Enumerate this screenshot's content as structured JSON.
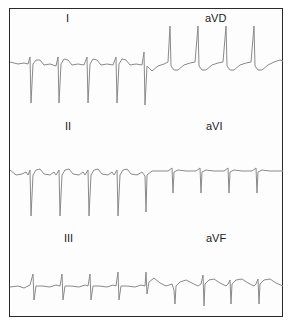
{
  "figure": {
    "type": "ECG limb leads strip",
    "leads": [
      {
        "name": "I",
        "row": 0,
        "side": "left",
        "qrs_polarity": "negative"
      },
      {
        "name": "aVD",
        "row": 0,
        "side": "right",
        "qrs_polarity": "positive"
      },
      {
        "name": "II",
        "row": 1,
        "side": "left",
        "qrs_polarity": "negative"
      },
      {
        "name": "aVI",
        "row": 1,
        "side": "right",
        "qrs_polarity": "negative-small"
      },
      {
        "name": "III",
        "row": 2,
        "side": "left",
        "qrs_polarity": "biphasic"
      },
      {
        "name": "aVF",
        "row": 2,
        "side": "right",
        "qrs_polarity": "biphasic"
      }
    ],
    "trace_color": "#8a8a8a",
    "border_color": "#2a2a2a"
  }
}
